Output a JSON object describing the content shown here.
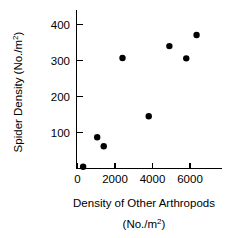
{
  "chart_data": {
    "type": "scatter",
    "title": "",
    "xlabel": "Density of Other Arthropods",
    "xlabel_units": "(No./m",
    "xlabel_units_exp": "2",
    "xlabel_units_close": ")",
    "ylabel": "Spider Density (No./m",
    "ylabel_exp": "2",
    "ylabel_close": ")",
    "xlim": [
      0,
      7000
    ],
    "ylim": [
      0,
      440
    ],
    "grid": false,
    "legend": "none",
    "marker": "filled-circle",
    "marker_color": "#000000",
    "xticks": [
      0,
      2000,
      4000,
      6000
    ],
    "xtick_labels": [
      "0",
      "2000",
      "4000",
      "6000"
    ],
    "yticks": [
      100,
      200,
      300,
      400
    ],
    "ytick_labels": [
      "100",
      "200",
      "300",
      "400"
    ],
    "points": [
      {
        "x": 300,
        "y": 5
      },
      {
        "x": 1050,
        "y": 87
      },
      {
        "x": 1400,
        "y": 62
      },
      {
        "x": 2400,
        "y": 307
      },
      {
        "x": 3800,
        "y": 145
      },
      {
        "x": 4900,
        "y": 340
      },
      {
        "x": 5800,
        "y": 306
      },
      {
        "x": 6350,
        "y": 371
      }
    ]
  },
  "axes": {
    "x_label_line1": "Density of Other Arthropods",
    "y_label_text": "Spider Density (No./m"
  }
}
